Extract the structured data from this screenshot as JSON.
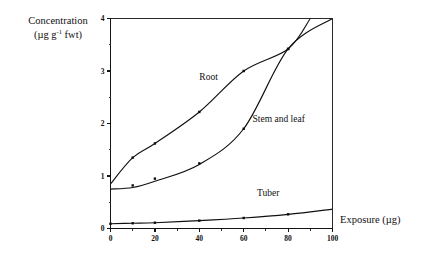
{
  "chart_data": {
    "type": "line",
    "title": "",
    "xlabel": "Exposure (µg)",
    "ylabel_line1": "Concentration",
    "ylabel_line2_prefix": "(µg g",
    "ylabel_line2_sup": "-1",
    "ylabel_line2_suffix": " fwt)",
    "xlim": [
      0,
      100
    ],
    "ylim": [
      0,
      4
    ],
    "xticks": [
      0,
      20,
      40,
      60,
      80,
      100
    ],
    "xtick_labels": [
      "0",
      "20",
      "40",
      "60",
      "80",
      "100"
    ],
    "xminor_ticks": [
      10,
      30,
      50,
      70,
      90
    ],
    "yticks": [
      0,
      1,
      2,
      3,
      4
    ],
    "ytick_labels": [
      "0",
      "1",
      "2",
      "3",
      "4"
    ],
    "yminor_ticks": [
      0.5,
      1.5,
      2.5,
      3.5
    ],
    "grid": false,
    "legend_position": "inline-annotations",
    "series": [
      {
        "name": "Root",
        "label": "Root",
        "label_x": 40,
        "label_y": 2.82,
        "x": [
          0,
          10,
          20,
          40,
          60,
          80,
          90
        ],
        "values": [
          0.85,
          1.35,
          1.62,
          2.22,
          3.0,
          3.42,
          4.0
        ],
        "marker_x": [
          10,
          20,
          40,
          60,
          80
        ],
        "marker_values": [
          1.35,
          1.62,
          2.22,
          3.0,
          3.42
        ]
      },
      {
        "name": "Stem and leaf",
        "label": "Stem and leaf",
        "label_x": 64,
        "label_y": 2.02,
        "x": [
          0,
          10,
          20,
          40,
          60,
          80,
          100
        ],
        "values": [
          0.75,
          0.78,
          0.9,
          1.22,
          1.9,
          3.42,
          4.0
        ],
        "marker_x": [
          10,
          20,
          40,
          60,
          80
        ],
        "marker_values": [
          0.82,
          0.95,
          1.24,
          1.9,
          3.42
        ]
      },
      {
        "name": "Tuber",
        "label": "Tuber",
        "label_x": 66,
        "label_y": 0.62,
        "x": [
          0,
          10,
          20,
          40,
          60,
          80,
          100
        ],
        "values": [
          0.09,
          0.1,
          0.11,
          0.15,
          0.2,
          0.27,
          0.37
        ],
        "marker_x": [
          0,
          10,
          20,
          40,
          60,
          80
        ],
        "marker_values": [
          0.09,
          0.1,
          0.11,
          0.15,
          0.2,
          0.27
        ]
      }
    ]
  }
}
